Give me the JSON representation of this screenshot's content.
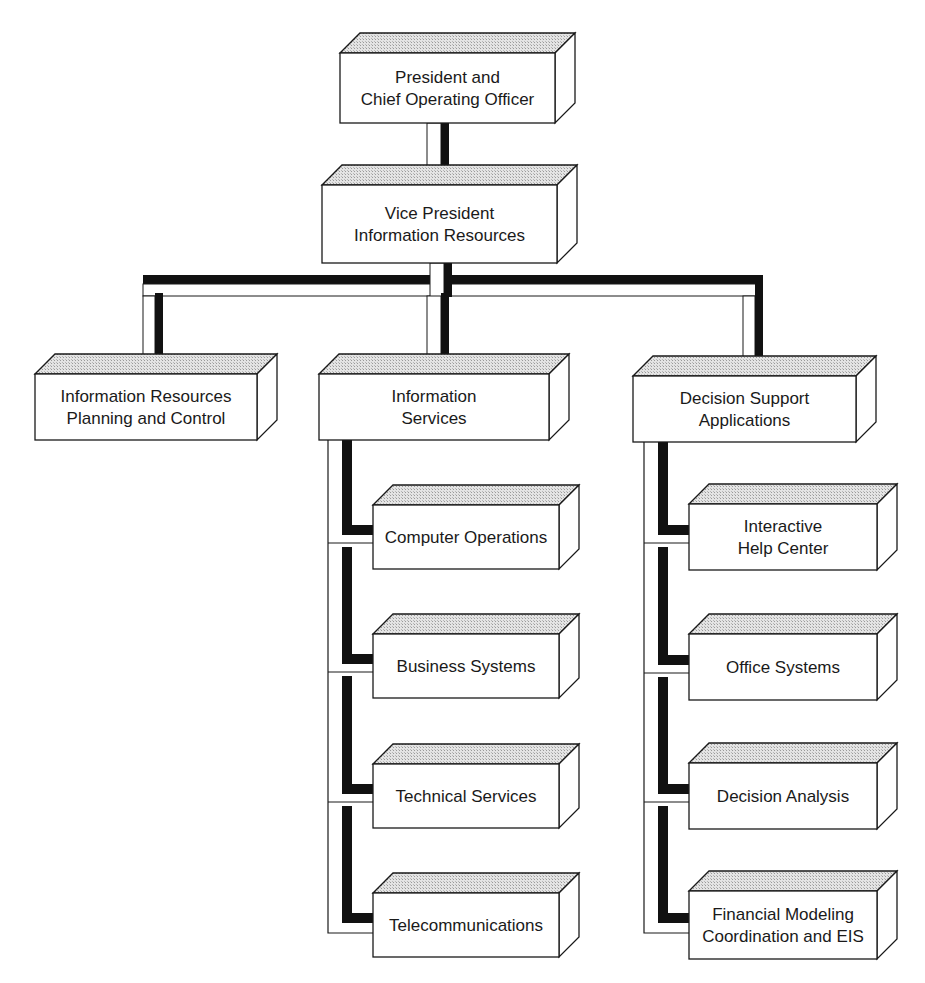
{
  "diagram": {
    "type": "org-chart",
    "colors": {
      "background": "#ffffff",
      "box_face": "#ffffff",
      "box_top": "#d9d9d9",
      "outline": "#1a1a1a",
      "connector_dark": "#111111",
      "connector_light": "#ffffff"
    },
    "nodes": [
      {
        "id": "president",
        "lines": [
          "President and",
          "Chief Operating Officer"
        ],
        "x": 340,
        "y": 53,
        "w": 215,
        "h": 70,
        "parent": null
      },
      {
        "id": "vp-info-resources",
        "lines": [
          "Vice President",
          "Information Resources"
        ],
        "x": 322,
        "y": 185,
        "w": 235,
        "h": 78,
        "parent": "president"
      },
      {
        "id": "ir-planning-control",
        "lines": [
          "Information Resources",
          "Planning and Control"
        ],
        "x": 35,
        "y": 374,
        "w": 222,
        "h": 66,
        "parent": "vp-info-resources"
      },
      {
        "id": "information-services",
        "lines": [
          "Information",
          "Services"
        ],
        "x": 319,
        "y": 374,
        "w": 230,
        "h": 66,
        "parent": "vp-info-resources"
      },
      {
        "id": "decision-support-apps",
        "lines": [
          "Decision Support",
          "Applications"
        ],
        "x": 633,
        "y": 376,
        "w": 223,
        "h": 66,
        "parent": "vp-info-resources"
      },
      {
        "id": "computer-operations",
        "lines": [
          "Computer Operations"
        ],
        "x": 373,
        "y": 505,
        "w": 186,
        "h": 64,
        "parent": "information-services"
      },
      {
        "id": "business-systems",
        "lines": [
          "Business Systems"
        ],
        "x": 373,
        "y": 634,
        "w": 186,
        "h": 64,
        "parent": "information-services"
      },
      {
        "id": "technical-services",
        "lines": [
          "Technical Services"
        ],
        "x": 373,
        "y": 764,
        "w": 186,
        "h": 64,
        "parent": "information-services"
      },
      {
        "id": "telecommunications",
        "lines": [
          "Telecommunications"
        ],
        "x": 373,
        "y": 893,
        "w": 186,
        "h": 64,
        "parent": "information-services"
      },
      {
        "id": "interactive-help-center",
        "lines": [
          "Interactive",
          "Help Center"
        ],
        "x": 689,
        "y": 504,
        "w": 188,
        "h": 66,
        "parent": "decision-support-apps"
      },
      {
        "id": "office-systems",
        "lines": [
          "Office Systems"
        ],
        "x": 689,
        "y": 634,
        "w": 188,
        "h": 66,
        "parent": "decision-support-apps"
      },
      {
        "id": "decision-analysis",
        "lines": [
          "Decision Analysis"
        ],
        "x": 689,
        "y": 763,
        "w": 188,
        "h": 66,
        "parent": "decision-support-apps"
      },
      {
        "id": "financial-modeling-eis",
        "lines": [
          "Financial Modeling",
          "Coordination and EIS"
        ],
        "x": 689,
        "y": 891,
        "w": 188,
        "h": 68,
        "parent": "decision-support-apps"
      }
    ]
  }
}
